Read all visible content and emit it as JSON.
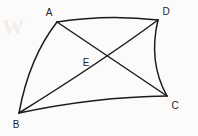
{
  "figure": {
    "background_color": "#fcfbfa",
    "stroke_color": "#1b1b1b",
    "label_color": "#242424",
    "watermark_text": "W",
    "vertices": [
      {
        "id": "A",
        "label": "A",
        "x": 57,
        "y": 22,
        "label_x": 49,
        "label_y": 13
      },
      {
        "id": "D",
        "label": "D",
        "x": 158,
        "y": 20,
        "label_x": 166,
        "label_y": 12
      },
      {
        "id": "B",
        "label": "B",
        "x": 19,
        "y": 113,
        "label_x": 16,
        "label_y": 125
      },
      {
        "id": "C",
        "label": "C",
        "x": 167,
        "y": 96,
        "label_x": 175,
        "label_y": 106
      },
      {
        "id": "E",
        "label": "E",
        "x": 84,
        "y": 50,
        "label_x": 86,
        "label_y": 63
      }
    ],
    "edges": [
      {
        "id": "AD",
        "from": "A",
        "to": "D",
        "kind": "curve",
        "bulge": "up",
        "path": "M 57 22 Q 107 14 158 20"
      },
      {
        "id": "AB",
        "from": "A",
        "to": "B",
        "kind": "curve",
        "bulge": "left",
        "path": "M 57 22 Q 29 58 19 113"
      },
      {
        "id": "BC",
        "from": "B",
        "to": "C",
        "kind": "curve",
        "bulge": "up",
        "path": "M 19 113 Q 94 97 167 96"
      },
      {
        "id": "DC",
        "from": "D",
        "to": "C",
        "kind": "curve",
        "bulge": "left",
        "path": "M 158 20 Q 148 62 167 96"
      }
    ],
    "diagonals": [
      {
        "id": "AC",
        "from": "A",
        "to": "C",
        "kind": "line",
        "path": "M 57 22 L 167 96"
      },
      {
        "id": "BD",
        "from": "B",
        "to": "D",
        "kind": "curve",
        "bulge": "up",
        "path": "M 19 113 Q 101 62 158 20"
      }
    ],
    "intersection": {
      "id": "E",
      "of": [
        "AC",
        "BD"
      ],
      "x": 84,
      "y": 50
    }
  }
}
